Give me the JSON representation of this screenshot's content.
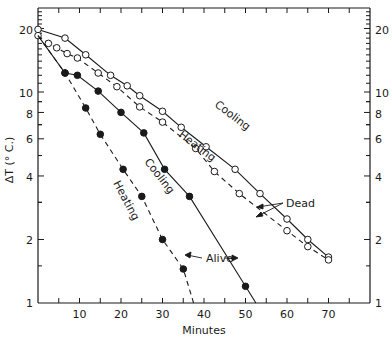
{
  "chart_data": {
    "type": "scatter",
    "title": "",
    "xlabel": "Minutes",
    "ylabel": "ΔT (° C.)",
    "xlim": [
      0,
      80
    ],
    "ylim": [
      1,
      25
    ],
    "yscale": "log",
    "grid": false,
    "x_ticks": [
      10,
      20,
      30,
      40,
      50,
      60,
      70
    ],
    "y_ticks_left": [
      1,
      2,
      4,
      6,
      8,
      10,
      20
    ],
    "y_ticks_right": [
      1,
      2,
      4,
      6,
      8,
      10,
      20
    ],
    "series": [
      {
        "name": "Dead – Cooling",
        "marker": "open-circle",
        "line": "solid",
        "x": [
          0,
          6.5,
          11.5,
          17.5,
          21.5,
          24.5,
          30,
          34.5,
          40.5,
          47.5,
          53.5,
          60,
          65,
          70
        ],
        "y": [
          19.8,
          18,
          15,
          12,
          10.7,
          9.6,
          8.1,
          6.8,
          5.5,
          4.3,
          3.3,
          2.5,
          2.0,
          1.65
        ]
      },
      {
        "name": "Dead – Heating",
        "marker": "open-circle",
        "line": "dashed",
        "x": [
          0,
          2.5,
          4.5,
          7,
          9.5,
          14.5,
          19,
          24.5,
          30,
          38,
          42.5,
          48.5,
          60,
          65,
          70
        ],
        "y": [
          18.5,
          17,
          16.2,
          15.2,
          14.5,
          12.3,
          10.6,
          8.5,
          7.2,
          5.4,
          4.2,
          3.3,
          2.2,
          1.85,
          1.6
        ]
      },
      {
        "name": "Alive – Cooling",
        "marker": "filled-circle",
        "line": "solid",
        "x": [
          6.5,
          9.5,
          14.5,
          20,
          25.5,
          30.5,
          36.5,
          50
        ],
        "y": [
          12.3,
          12.0,
          10.1,
          8.0,
          6.4,
          4.3,
          3.2,
          1.2
        ]
      },
      {
        "name": "Alive – Heating",
        "marker": "filled-circle",
        "line": "dashed",
        "x": [
          6.5,
          11.5,
          15,
          20.5,
          25,
          30,
          35
        ],
        "y": [
          12.3,
          8.4,
          6.3,
          4.3,
          3.2,
          2.0,
          1.45
        ]
      }
    ],
    "annotations": [
      {
        "text": "Cooling",
        "near": "Dead cooling line"
      },
      {
        "text": "Heating",
        "near": "Dead heating line"
      },
      {
        "text": "Cooling",
        "near": "Alive cooling line"
      },
      {
        "text": "Heating",
        "near": "Alive heating line"
      },
      {
        "text": "Dead",
        "arrows_to": [
          "Dead cooling",
          "Dead heating"
        ]
      },
      {
        "text": "Alive",
        "arrows_to": [
          "Alive heating",
          "Alive cooling"
        ]
      }
    ]
  },
  "labels": {
    "ylabel": "ΔT (° C.)",
    "xlabel": "Minutes",
    "dead": "Dead",
    "alive": "Alive",
    "cooling_dead": "Cooling",
    "heating_dead": "Heating",
    "cooling_alive": "Cooling",
    "heating_alive": "Heating",
    "x10": "10",
    "x20": "20",
    "x30": "30",
    "x40": "40",
    "x50": "50",
    "x60": "60",
    "x70": "70",
    "y1": "1",
    "y2": "2",
    "y4": "4",
    "y6": "6",
    "y8": "8",
    "y10": "10",
    "y20": "20"
  }
}
